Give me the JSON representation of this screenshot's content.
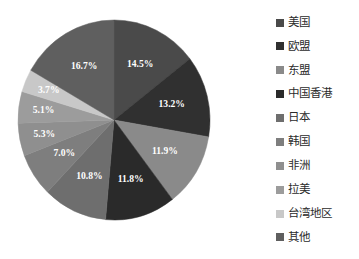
{
  "chart_data": {
    "type": "pie",
    "title": "",
    "subtitle": "",
    "xlabel": "",
    "ylabel": "",
    "grid": false,
    "legend_position": "right",
    "start_angle_deg": 0,
    "direction": "clockwise",
    "total_percent": "100.0%",
    "categories": [
      "美国",
      "欧盟",
      "东盟",
      "中国香港",
      "日本",
      "韩国",
      "非洲",
      "拉美",
      "台湾地区",
      "其他"
    ],
    "values": [
      14.5,
      13.2,
      11.9,
      11.8,
      10.8,
      7.0,
      5.3,
      5.1,
      3.7,
      16.7
    ],
    "labels": [
      "14.5%",
      "13.2%",
      "11.9%",
      "11.8%",
      "10.8%",
      "7.0%",
      "5.3%",
      "5.1%",
      "3.7%",
      "16.7%"
    ],
    "colors": [
      "#4a4a4a",
      "#303030",
      "#8a8a8a",
      "#2a2a2a",
      "#6e6e6e",
      "#7e7e7e",
      "#8f8f8f",
      "#9c9c9c",
      "#c8c8c8",
      "#5f5f5f"
    ],
    "slices": [
      {
        "name": "美国",
        "value": 14.5,
        "label": "14.5%",
        "color": "#4a4a4a"
      },
      {
        "name": "欧盟",
        "value": 13.2,
        "label": "13.2%",
        "color": "#303030"
      },
      {
        "name": "东盟",
        "value": 11.9,
        "label": "11.9%",
        "color": "#8a8a8a"
      },
      {
        "name": "中国香港",
        "value": 11.8,
        "label": "11.8%",
        "color": "#2a2a2a"
      },
      {
        "name": "日本",
        "value": 10.8,
        "label": "10.8%",
        "color": "#6e6e6e"
      },
      {
        "name": "韩国",
        "value": 7.0,
        "label": "7.0%",
        "color": "#7e7e7e"
      },
      {
        "name": "非洲",
        "value": 5.3,
        "label": "5.3%",
        "color": "#8f8f8f"
      },
      {
        "name": "拉美",
        "value": 5.1,
        "label": "5.1%",
        "color": "#9c9c9c"
      },
      {
        "name": "台湾地区",
        "value": 3.7,
        "label": "3.7%",
        "color": "#c8c8c8"
      },
      {
        "name": "其他",
        "value": 16.7,
        "label": "16.7%",
        "color": "#5f5f5f"
      }
    ]
  },
  "legend": {
    "items": [
      {
        "label": "美国",
        "color": "#4a4a4a"
      },
      {
        "label": "欧盟",
        "color": "#303030"
      },
      {
        "label": "东盟",
        "color": "#8a8a8a"
      },
      {
        "label": "中国香港",
        "color": "#2a2a2a"
      },
      {
        "label": "日本",
        "color": "#6e6e6e"
      },
      {
        "label": "韩国",
        "color": "#7e7e7e"
      },
      {
        "label": "非洲",
        "color": "#8f8f8f"
      },
      {
        "label": "拉美",
        "color": "#9c9c9c"
      },
      {
        "label": "台湾地区",
        "color": "#c8c8c8"
      },
      {
        "label": "其他",
        "color": "#5f5f5f"
      }
    ]
  }
}
